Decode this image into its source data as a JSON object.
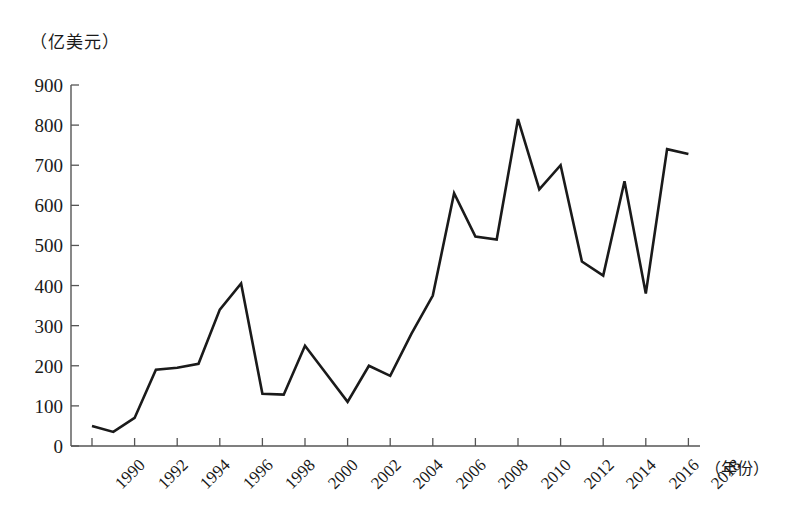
{
  "chart_data": {
    "type": "line",
    "title": "",
    "ylabel": "（亿美元）",
    "xlabel": "（年份）",
    "ylim": [
      0,
      900
    ],
    "yticks": [
      0,
      100,
      200,
      300,
      400,
      500,
      600,
      700,
      800,
      900
    ],
    "xlim": [
      1990,
      2018
    ],
    "xticks": [
      1990,
      1992,
      1994,
      1996,
      1998,
      2000,
      2002,
      2004,
      2006,
      2008,
      2010,
      2012,
      2014,
      2016,
      2018
    ],
    "xtick_labels": [
      "1990",
      "1992",
      "1994",
      "1996",
      "1998",
      "2000",
      "2002",
      "2004",
      "2006",
      "2008",
      "2010",
      "2012",
      "2014",
      "2016",
      "2018"
    ],
    "ytick_labels": [
      "0",
      "100",
      "200",
      "300",
      "400",
      "500",
      "600",
      "700",
      "800",
      "900"
    ],
    "grid": false,
    "legend": null,
    "x": [
      1990,
      1991,
      1992,
      1993,
      1994,
      1995,
      1996,
      1997,
      1998,
      1999,
      2000,
      2001,
      2002,
      2003,
      2004,
      2005,
      2006,
      2007,
      2008,
      2009,
      2010,
      2011,
      2012,
      2013,
      2014,
      2015,
      2016,
      2017,
      2018
    ],
    "values": [
      50,
      35,
      70,
      190,
      195,
      205,
      340,
      405,
      130,
      128,
      250,
      180,
      110,
      200,
      175,
      280,
      375,
      630,
      522,
      515,
      815,
      640,
      700,
      460,
      425,
      660,
      380,
      740,
      728
    ],
    "series": [
      {
        "name": "",
        "color": "#1a1a1a",
        "values": [
          50,
          35,
          70,
          190,
          195,
          205,
          340,
          405,
          130,
          128,
          250,
          180,
          110,
          200,
          175,
          280,
          375,
          630,
          522,
          515,
          815,
          640,
          700,
          460,
          425,
          660,
          380,
          740,
          728
        ]
      }
    ]
  },
  "axes": {
    "line_color": "#555555",
    "series_color": "#1a1a1a"
  }
}
